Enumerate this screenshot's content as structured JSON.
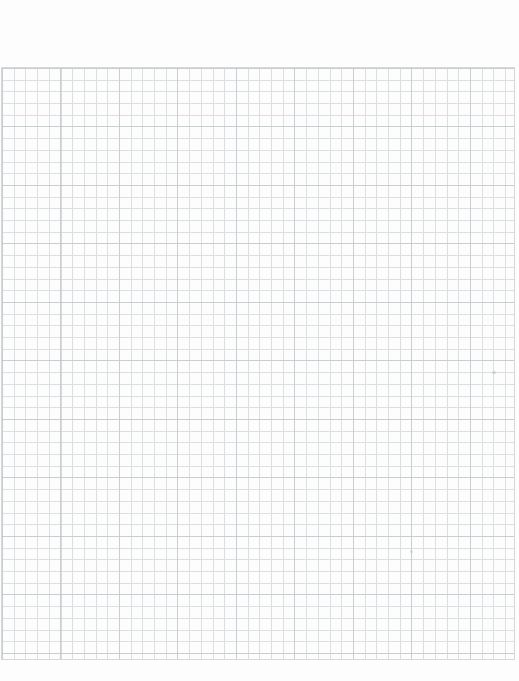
{
  "page": {
    "type": "blank quad-ruled graph paper scan",
    "width_px": 519,
    "height_px": 681,
    "margin_color": "#ffffff",
    "paper_color": "#fdfdfd"
  },
  "grid": {
    "left_px": 1,
    "top_px": 67,
    "width_px": 514,
    "height_px": 593,
    "cell_size_px": 11.7,
    "columns": 44,
    "rows": 51,
    "line_color": "#dcdfe0",
    "accent_line_color": "rgba(186,192,195,0.55)",
    "accent_step_px": 58.5,
    "border_color": "#d5d8da"
  },
  "artifacts": [
    {
      "id": "speck-artifact-1",
      "x_px": 492,
      "y_px": 371,
      "width_px": 4,
      "height_px": 3,
      "color": "#b6babc"
    },
    {
      "id": "speck-artifact-2",
      "x_px": 410,
      "y_px": 550,
      "width_px": 3,
      "height_px": 3,
      "color": "#c2c6c8"
    }
  ],
  "css_vars": {
    "--margin-color": "#ffffff",
    "--paper-color": "#fdfdfd",
    "--grid-left": "1px",
    "--grid-top": "67px",
    "--grid-width": "514px",
    "--grid-height": "593px",
    "--cell": "11.7px",
    "--line-color": "#dcdfe0",
    "--accent-line-color": "rgba(186,192,195,0.55)",
    "--accent-step": "58.5px",
    "--grid-border-color": "#d5d8da"
  }
}
